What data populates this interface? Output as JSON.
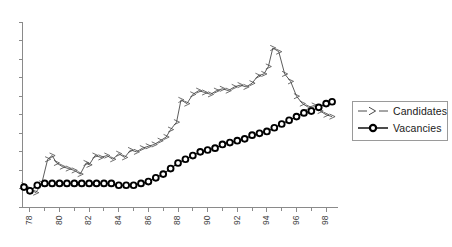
{
  "chart_data": {
    "type": "line",
    "title": "",
    "subtitle": "",
    "xlabel": "",
    "ylabel": "",
    "grid": false,
    "legend_position": "right",
    "xlim": [
      1977.5,
      1998.8
    ],
    "ylim": [
      0,
      100
    ],
    "x_tick_labels": [
      "78",
      "80",
      "82",
      "84",
      "86",
      "88",
      "90",
      "92",
      "94",
      "96",
      "98"
    ],
    "x_tick_values": [
      1978,
      1980,
      1982,
      1984,
      1986,
      1988,
      1990,
      1992,
      1994,
      1996,
      1998
    ],
    "x_minor_tick_values": [
      1979,
      1981,
      1983,
      1985,
      1987,
      1989,
      1991,
      1993,
      1995,
      1997
    ],
    "y_ticks_unlabeled_count": 10,
    "y_axis_labels_visible": false,
    "series": [
      {
        "name": "Candidates",
        "marker": "triangle-right",
        "color": "#4a4a4a",
        "x": [
          1977.6,
          1978.0,
          1978.4,
          1978.8,
          1979.2,
          1979.5,
          1979.8,
          1980.2,
          1980.6,
          1981.0,
          1981.4,
          1981.8,
          1982.0,
          1982.4,
          1982.8,
          1983.2,
          1983.6,
          1984.0,
          1984.4,
          1984.8,
          1985.2,
          1985.6,
          1986.0,
          1986.4,
          1986.8,
          1987.2,
          1987.5,
          1987.9,
          1988.2,
          1988.6,
          1989.0,
          1989.4,
          1989.8,
          1990.2,
          1990.6,
          1991.0,
          1991.4,
          1991.8,
          1992.2,
          1992.6,
          1993.0,
          1993.4,
          1993.8,
          1994.1,
          1994.4,
          1994.8,
          1995.2,
          1995.6,
          1996.0,
          1996.4,
          1996.8,
          1997.2,
          1997.6,
          1998.0,
          1998.4
        ],
        "y": [
          12,
          10,
          8,
          13,
          26,
          28,
          24,
          22,
          21,
          20,
          18,
          24,
          23,
          28,
          27,
          28,
          26,
          29,
          27,
          31,
          30,
          32,
          33,
          34,
          36,
          38,
          42,
          46,
          58,
          56,
          61,
          63,
          62,
          61,
          63,
          64,
          63,
          65,
          66,
          65,
          67,
          71,
          72,
          76,
          86,
          84,
          72,
          68,
          60,
          56,
          54,
          55,
          52,
          50,
          49
        ],
        "peak_year": 1994,
        "peak_value": 86
      },
      {
        "name": "Vacancies",
        "marker": "circle",
        "color": "#000000",
        "x": [
          1977.6,
          1978.0,
          1978.5,
          1979.0,
          1979.5,
          1980.0,
          1980.5,
          1981.0,
          1981.5,
          1982.0,
          1982.5,
          1983.0,
          1983.5,
          1984.0,
          1984.5,
          1985.0,
          1985.5,
          1986.0,
          1986.5,
          1987.0,
          1987.5,
          1988.0,
          1988.5,
          1989.0,
          1989.5,
          1990.0,
          1990.5,
          1991.0,
          1991.5,
          1992.0,
          1992.5,
          1993.0,
          1993.5,
          1994.0,
          1994.5,
          1995.0,
          1995.5,
          1996.0,
          1996.5,
          1997.0,
          1997.5,
          1998.0,
          1998.4
        ],
        "y": [
          11,
          9,
          12,
          13,
          13,
          13,
          13,
          13,
          13,
          13,
          13,
          13,
          13,
          12,
          12,
          12,
          13,
          14,
          16,
          18,
          21,
          24,
          26,
          28,
          30,
          31,
          32,
          34,
          35,
          36,
          37,
          39,
          40,
          41,
          43,
          45,
          47,
          49,
          51,
          52,
          54,
          56,
          57
        ]
      }
    ]
  },
  "legend": {
    "items": [
      {
        "label": "Candidates",
        "marker": "triangle-right"
      },
      {
        "label": "Vacancies",
        "marker": "circle"
      }
    ]
  }
}
